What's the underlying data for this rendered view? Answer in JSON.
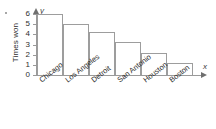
{
  "chart_data": {
    "type": "bar",
    "title": "",
    "subtitle": "",
    "xlabel": "",
    "ylabel": "Times won",
    "categories": [
      "Chicago",
      "Los Angeles",
      "Detroit",
      "San Antonio",
      "Houston",
      "Boston"
    ],
    "values": [
      6,
      5,
      4.2,
      3.2,
      2.2,
      1.2
    ],
    "ylim": [
      0,
      6
    ],
    "yticks": [
      0,
      1,
      2,
      3,
      4,
      5,
      6
    ],
    "ytick_labels": [
      "0",
      "1",
      "2",
      "3",
      "4",
      "5",
      "6"
    ],
    "grid": false,
    "legend": null,
    "axis_markers": {
      "x_axis_letter": "x",
      "y_axis_letter": "y"
    },
    "bar_style": {
      "fill": "#ffffff",
      "outline": "#9d9d9d"
    }
  },
  "axes": {
    "y_title": "Times won",
    "y_letter": "y",
    "x_letter": "x"
  }
}
